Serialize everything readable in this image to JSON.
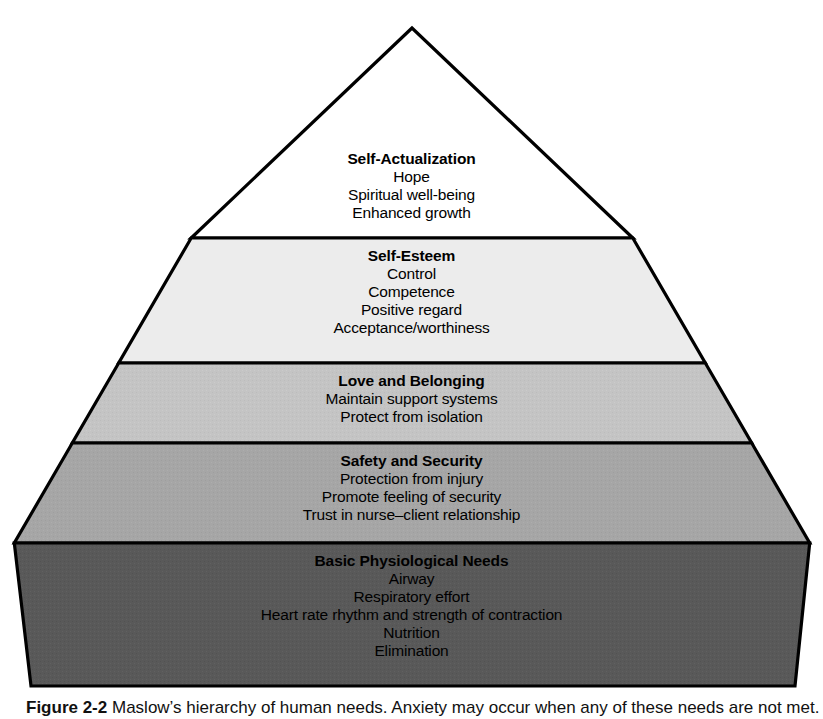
{
  "figure": {
    "type": "pyramid-diagram",
    "width": 823,
    "height": 714
  },
  "caption": {
    "label": "Figure 2-2",
    "body": "Maslow’s hierarchy of human needs. Anxiety may occur when any of these needs are not met."
  },
  "colors": {
    "outline": "#000000",
    "text": "#000000",
    "background": "#ffffff",
    "tier_0_fill": "#ffffff",
    "tier_1_fill": "#ececec",
    "tier_2_fill": "#c4c4c4",
    "tier_3_fill": "#a6a6a6",
    "tier_4_fill": "#595959"
  },
  "pyramid": {
    "apex": {
      "x": 412,
      "y": 28
    },
    "base_left": {
      "x": 31,
      "y": 686
    },
    "base_right": {
      "x": 795,
      "y": 686
    },
    "divider_y": [
      238,
      363,
      443,
      543
    ],
    "tiers": [
      {
        "id": "self-actualization",
        "level": 5,
        "title": "Self-Actualization",
        "items": [
          "Hope",
          "Spiritual well-being",
          "Enhanced growth"
        ],
        "fill": "#ffffff"
      },
      {
        "id": "self-esteem",
        "level": 4,
        "title": "Self-Esteem",
        "items": [
          "Control",
          "Competence",
          "Positive regard",
          "Acceptance/worthiness"
        ],
        "fill": "#ececec"
      },
      {
        "id": "love-and-belonging",
        "level": 3,
        "title": "Love and Belonging",
        "items": [
          "Maintain support systems",
          "Protect from isolation"
        ],
        "fill": "#c4c4c4"
      },
      {
        "id": "safety-and-security",
        "level": 2,
        "title": "Safety and Security",
        "items": [
          "Protection from injury",
          "Promote feeling of security",
          "Trust in nurse–client relationship"
        ],
        "fill": "#a6a6a6"
      },
      {
        "id": "basic-physiological-needs",
        "level": 1,
        "title": "Basic Physiological Needs",
        "items": [
          "Airway",
          "Respiratory effort",
          "Heart rate rhythm and strength of contraction",
          "Nutrition",
          "Elimination"
        ],
        "fill": "#595959"
      }
    ]
  }
}
